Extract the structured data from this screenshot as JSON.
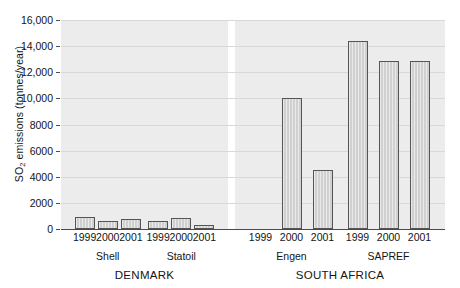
{
  "chart_data": {
    "type": "bar",
    "title": "",
    "xlabel": "",
    "ylabel": "SO2 emissions (tonnes/year)",
    "ylabel_prefix": "SO",
    "ylabel_sub": "2",
    "ylabel_suffix": " emissions (tonnes/year)",
    "ylim": [
      0,
      16000
    ],
    "ytick_step": 2000,
    "yticks": [
      "0",
      "2000",
      "4000",
      "6000",
      "8000",
      "10,000",
      "12,000",
      "14,000",
      "16,000"
    ],
    "ytick_values": [
      0,
      2000,
      4000,
      6000,
      8000,
      10000,
      12000,
      14000,
      16000
    ],
    "grid": true,
    "legend": "none",
    "categories": [
      "1999",
      "2000",
      "2001",
      "1999",
      "2000",
      "2001",
      "1999",
      "2000",
      "2001",
      "1999",
      "2000",
      "2001"
    ],
    "values": [
      900,
      600,
      800,
      600,
      850,
      300,
      null,
      10000,
      4500,
      14400,
      12900,
      12850
    ],
    "panels": [
      {
        "country": "DENMARK",
        "groups": [
          {
            "name": "Shell",
            "bars": [
              {
                "year": "1999",
                "value": 900
              },
              {
                "year": "2000",
                "value": 600
              },
              {
                "year": "2001",
                "value": 800
              }
            ]
          },
          {
            "name": "Statoil",
            "bars": [
              {
                "year": "1999",
                "value": 600
              },
              {
                "year": "2000",
                "value": 850
              },
              {
                "year": "2001",
                "value": 300
              }
            ]
          }
        ]
      },
      {
        "country": "SOUTH AFRICA",
        "groups": [
          {
            "name": "Engen",
            "bars": [
              {
                "year": "1999",
                "value": null
              },
              {
                "year": "2000",
                "value": 10000
              },
              {
                "year": "2001",
                "value": 4500
              }
            ]
          },
          {
            "name": "SAPREF",
            "bars": [
              {
                "year": "1999",
                "value": 14400
              },
              {
                "year": "2000",
                "value": 12900
              },
              {
                "year": "2001",
                "value": 12850
              }
            ]
          }
        ]
      }
    ]
  },
  "colors": {
    "bar_fill": "#d0d0d0",
    "bar_stroke": "#555555",
    "panel_bg": "#ececec",
    "axis": "#4a4a4a",
    "text": "#141414",
    "background": "#ffffff"
  }
}
